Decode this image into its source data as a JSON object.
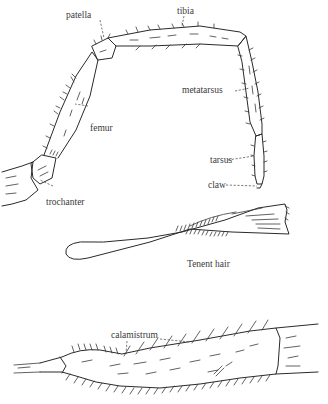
{
  "figure": {
    "leg": {
      "labels": {
        "patella": "patella",
        "tibia": "tibia",
        "femur": "femur",
        "metatarsus": "metatarsus",
        "tarsus": "tarsus",
        "claw": "claw",
        "trochanter": "trochanter"
      }
    },
    "tenent_hair": {
      "label": "Tenent hair"
    },
    "calamistrum_segment": {
      "label": "calamistrum"
    },
    "caption": {
      "text": "",
      "truncated": true
    },
    "colors": {
      "ink": "#2a2a2a",
      "label_text": "#3a3a3a",
      "background": "#ffffff"
    }
  }
}
